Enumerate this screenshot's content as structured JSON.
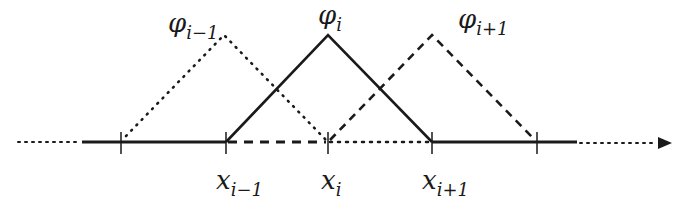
{
  "diagram": {
    "axis": {
      "y": 142,
      "x_start": 82,
      "x_end": 577,
      "dot_start": 18,
      "dot_end": 660,
      "arrow_tip": 672,
      "color": "#1a1a1a"
    },
    "nodes": [
      {
        "id": "x_im2",
        "x": 121,
        "label": "",
        "sub": ""
      },
      {
        "id": "x_im1",
        "x": 226,
        "label": "x",
        "sub": "i−1"
      },
      {
        "id": "x_i",
        "x": 328,
        "label": "x",
        "sub": "i"
      },
      {
        "id": "x_ip1",
        "x": 432,
        "label": "x",
        "sub": "i+1"
      },
      {
        "id": "x_ip2",
        "x": 537,
        "label": "",
        "sub": ""
      }
    ],
    "functions": [
      {
        "id": "phi_im1",
        "label": "φ",
        "sub": "i−1",
        "style": "dotted",
        "left": 121,
        "peak": 226,
        "right": 328
      },
      {
        "id": "phi_i",
        "label": "φ",
        "sub": "i",
        "style": "solid",
        "left": 226,
        "peak": 328,
        "right": 432
      },
      {
        "id": "phi_ip1",
        "label": "φ",
        "sub": "i+1",
        "style": "dashed",
        "left": 328,
        "peak": 432,
        "right": 537
      }
    ],
    "peak_y": 35,
    "labels": {
      "phi_im1": {
        "main": "φ",
        "sub": "i−1"
      },
      "phi_i": {
        "main": "φ",
        "sub": "i"
      },
      "phi_ip1": {
        "main": "φ",
        "sub": "i+1"
      },
      "x_im1": {
        "main": "x",
        "sub": "i−1"
      },
      "x_i": {
        "main": "x",
        "sub": "i"
      },
      "x_ip1": {
        "main": "x",
        "sub": "i+1"
      }
    }
  }
}
